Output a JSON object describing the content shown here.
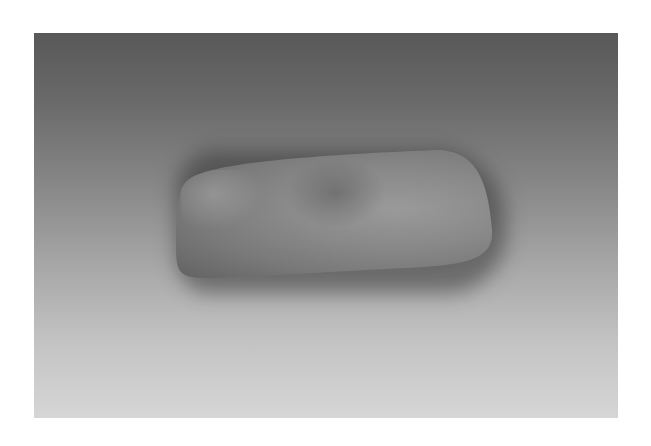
{
  "image": {
    "subject": "polished stone axe head",
    "background": "gray gradient photographic backdrop",
    "colors": {
      "frame": "#ffffff",
      "backdrop_top": "#585858",
      "backdrop_bottom": "#d6d6d6",
      "stone": "#8a8a8a"
    }
  }
}
